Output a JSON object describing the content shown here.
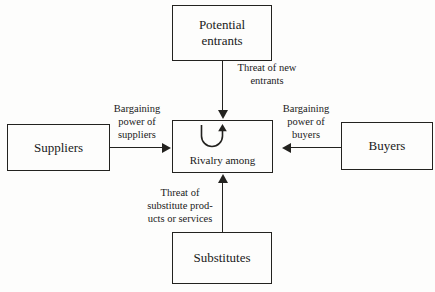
{
  "diagram": {
    "background_color": "#fdfdfc",
    "line_color": "#23221f",
    "text_color": "#1a1a1a",
    "nodes": [
      {
        "id": "potential-entrants",
        "label": "Potential\nentrants"
      },
      {
        "id": "suppliers",
        "label": "Suppliers"
      },
      {
        "id": "rivalry",
        "label": "Rivalry among"
      },
      {
        "id": "buyers",
        "label": "Buyers"
      },
      {
        "id": "substitutes",
        "label": "Substitutes"
      }
    ],
    "edges": [
      {
        "id": "threat-new-entrants",
        "from": "potential-entrants",
        "to": "rivalry",
        "direction": "down",
        "label": "Threat of new\nentrants"
      },
      {
        "id": "bargaining-power-suppliers",
        "from": "suppliers",
        "to": "rivalry",
        "direction": "right",
        "label": "Bargaining\npower of\nsuppliers"
      },
      {
        "id": "bargaining-power-buyers",
        "from": "buyers",
        "to": "rivalry",
        "direction": "left",
        "label": "Bargaining\npower of\nbuyers"
      },
      {
        "id": "threat-substitutes",
        "from": "substitutes",
        "to": "rivalry",
        "direction": "up",
        "label": "Threat of\nsubstitute prod-\nucts or services"
      }
    ],
    "icons": {
      "rivalry_loop": "circular-arrow-icon"
    }
  }
}
